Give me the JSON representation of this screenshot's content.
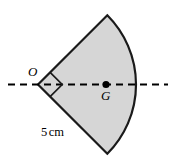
{
  "figure": {
    "type": "geometry-diagram",
    "labels": {
      "vertex": "O",
      "centroid": "G",
      "radius_value": "5",
      "radius_unit": "cm"
    },
    "colors": {
      "fill": "#d6d6d6",
      "stroke": "#1a1a1a",
      "axis": "#000000",
      "point": "#000000",
      "background": "#ffffff"
    },
    "geometry": {
      "vertex_x": 38,
      "vertex_y": 84.5,
      "radius_px": 98,
      "sector_angle_deg": 90,
      "start_angle_deg": -45,
      "end_angle_deg": 45,
      "centroid_x": 106,
      "centroid_y": 84.5,
      "point_radius_px": 3.6,
      "right_angle_marker_size_px": 17,
      "axis_start_x": 8,
      "axis_end_x": 168,
      "axis_y": 84.5,
      "axis_dash": "7,5",
      "stroke_width": 2.2
    }
  }
}
